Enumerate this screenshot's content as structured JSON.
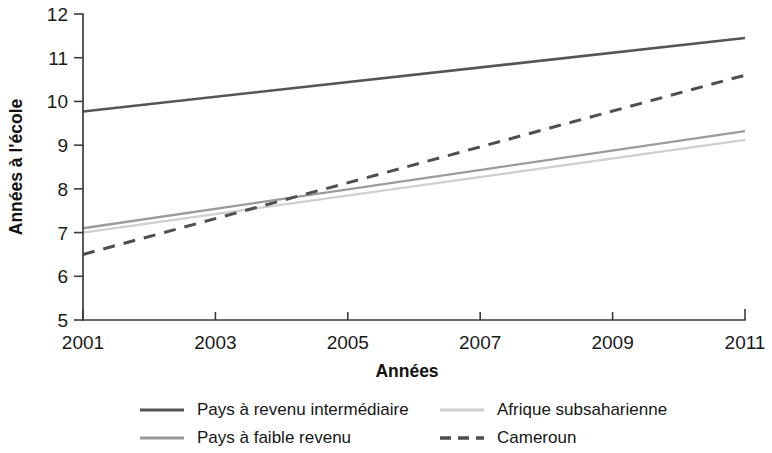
{
  "chart_data": {
    "type": "line",
    "title": "",
    "xlabel": "Années",
    "ylabel": "Années à l'école",
    "x": [
      2001,
      2011
    ],
    "xlim": [
      2001,
      2011
    ],
    "ylim": [
      5,
      12
    ],
    "x_ticks": [
      "2001",
      "2003",
      "2005",
      "2007",
      "2009",
      "2011"
    ],
    "x_tick_values": [
      2001,
      2003,
      2005,
      2007,
      2009,
      2011
    ],
    "y_ticks": [
      "5",
      "6",
      "7",
      "8",
      "9",
      "10",
      "11",
      "12"
    ],
    "y_tick_values": [
      5,
      6,
      7,
      8,
      9,
      10,
      11,
      12
    ],
    "grid": false,
    "legend_position": "bottom",
    "series": [
      {
        "name": "Pays à revenu intermédiaire",
        "values": [
          9.77,
          11.45
        ],
        "color": "#555555",
        "width": 2.6,
        "dash": "none"
      },
      {
        "name": "Pays à faible revenu",
        "values": [
          7.1,
          9.32
        ],
        "color": "#9a9a9a",
        "width": 2.4,
        "dash": "none"
      },
      {
        "name": "Afrique subsaharienne",
        "values": [
          7.0,
          9.12
        ],
        "color": "#cfcfcf",
        "width": 2.2,
        "dash": "none"
      },
      {
        "name": "Cameroun",
        "values": [
          6.5,
          10.6
        ],
        "color": "#4f4f4f",
        "width": 3.0,
        "dash": "12,9"
      }
    ]
  },
  "legend": {
    "entries": [
      {
        "label": "Pays à revenu intermédiaire",
        "series_index": 0
      },
      {
        "label": "Pays à faible revenu",
        "series_index": 1
      },
      {
        "label": "Afrique subsaharienne",
        "series_index": 2
      },
      {
        "label": "Cameroun",
        "series_index": 3
      }
    ]
  }
}
